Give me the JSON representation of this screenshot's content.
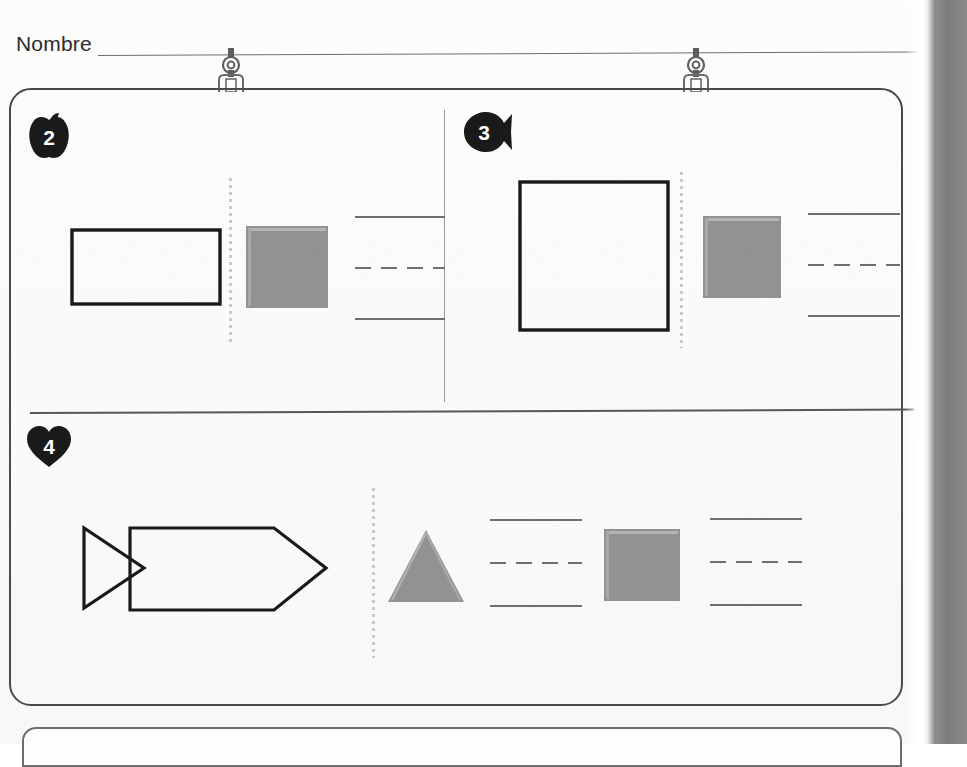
{
  "page": {
    "language": "es",
    "name_label": "Nombre",
    "name_value": "",
    "paper_color": "#fbfbfa",
    "ink_color": "#2b2b2b",
    "rule_color": "#6e6e6e",
    "shape_fill_color": "#929292",
    "shape_outline_color": "#1a1a1a",
    "divider_color": "#575757",
    "dotted_color": "#c9c9c9",
    "writing_line_color": "#6f6f6f",
    "page_edge_color": "#7c7c7c"
  },
  "binder_clips": [
    {
      "name": "binder-clip-left",
      "x": 214,
      "icon": "binder-ring-icon"
    },
    {
      "name": "binder-clip-right",
      "x": 679,
      "icon": "binder-ring-icon"
    }
  ],
  "exercises": [
    {
      "id": "exercise-2",
      "number": "2",
      "badge_shape": "apple",
      "badge_icon": "apple-badge-icon",
      "items": [
        {
          "role": "model-shape",
          "shape": "rectangle",
          "style": "outline",
          "name": "rectangle-outline"
        },
        {
          "role": "separator",
          "shape": "dotted-line",
          "name": "dotted-separator"
        },
        {
          "role": "example-shape",
          "shape": "square",
          "style": "filled-gray",
          "name": "gray-square"
        },
        {
          "role": "answer-area",
          "shape": "writing-lines",
          "name": "writing-lines",
          "value": ""
        }
      ]
    },
    {
      "id": "exercise-3",
      "number": "3",
      "badge_shape": "fish",
      "badge_icon": "fish-badge-icon",
      "items": [
        {
          "role": "model-shape",
          "shape": "square",
          "style": "outline",
          "name": "square-outline"
        },
        {
          "role": "separator",
          "shape": "dotted-line",
          "name": "dotted-separator"
        },
        {
          "role": "example-shape",
          "shape": "square",
          "style": "filled-gray",
          "name": "gray-square"
        },
        {
          "role": "answer-area",
          "shape": "writing-lines",
          "name": "writing-lines",
          "value": ""
        }
      ]
    },
    {
      "id": "exercise-4",
      "number": "4",
      "badge_shape": "heart",
      "badge_icon": "heart-badge-icon",
      "items": [
        {
          "role": "model-shape",
          "shape": "fish-outline",
          "style": "outline",
          "name": "fish-outline"
        },
        {
          "role": "separator",
          "shape": "dotted-line",
          "name": "dotted-separator"
        },
        {
          "role": "example-shape",
          "shape": "triangle",
          "style": "filled-gray",
          "name": "gray-triangle"
        },
        {
          "role": "answer-area",
          "shape": "writing-lines",
          "name": "writing-lines-triangle",
          "value": ""
        },
        {
          "role": "example-shape",
          "shape": "square",
          "style": "filled-gray",
          "name": "gray-square"
        },
        {
          "role": "answer-area",
          "shape": "writing-lines",
          "name": "writing-lines-square",
          "value": ""
        }
      ]
    }
  ]
}
